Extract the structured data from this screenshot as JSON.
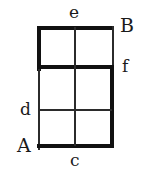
{
  "figure": {
    "background_color": "#ffffff",
    "stroke_color": "#1a1a1a",
    "grid": {
      "columns": 2,
      "rows": 3,
      "left": 37,
      "top": 26,
      "right": 114,
      "bottom": 148,
      "column_divider_x": 75,
      "row_divider_1_y": 67,
      "row_divider_2_y": 110,
      "thick_width": 4,
      "thin_width": 2
    }
  },
  "labels": {
    "e": {
      "text": "e",
      "case": "lower",
      "position": "top-center-outside",
      "x": 69,
      "y": 4
    },
    "B": {
      "text": "B",
      "case": "upper",
      "position": "top-right-outside",
      "x": 120,
      "y": 16
    },
    "f": {
      "text": "f",
      "case": "lower",
      "position": "right-middle-outside",
      "x": 122,
      "y": 58
    },
    "d": {
      "text": "d",
      "case": "lower",
      "position": "left-middle-outside",
      "x": 20,
      "y": 101
    },
    "A": {
      "text": "A",
      "case": "upper",
      "position": "bottom-left-outside",
      "x": 17,
      "y": 136
    },
    "c": {
      "text": "c",
      "case": "lower",
      "position": "bottom-center-outside",
      "x": 70,
      "y": 152
    }
  },
  "segments": [
    {
      "name": "outer-top-edge",
      "weight": "thick",
      "x": 37,
      "y": 26,
      "w": 77,
      "h": 4
    },
    {
      "name": "outer-left-edge-upper",
      "weight": "thick",
      "x": 37,
      "y": 26,
      "w": 4,
      "h": 45
    },
    {
      "name": "outer-left-edge-lower",
      "weight": "thin",
      "x": 38,
      "y": 67,
      "w": 2,
      "h": 83
    },
    {
      "name": "outer-bottom-edge",
      "weight": "thick",
      "x": 37,
      "y": 144,
      "w": 77,
      "h": 4
    },
    {
      "name": "outer-right-edge-upper",
      "weight": "thin",
      "x": 112,
      "y": 26,
      "w": 2,
      "h": 43
    },
    {
      "name": "outer-right-edge-lower",
      "weight": "thick",
      "x": 110,
      "y": 67,
      "w": 4,
      "h": 81
    },
    {
      "name": "row-divider-upper",
      "weight": "thick",
      "x": 37,
      "y": 65,
      "w": 77,
      "h": 4
    },
    {
      "name": "row-divider-lower",
      "weight": "thin",
      "x": 38,
      "y": 109,
      "w": 74,
      "h": 2
    },
    {
      "name": "column-divider",
      "weight": "thin",
      "x": 74,
      "y": 27,
      "w": 2,
      "h": 119
    }
  ]
}
